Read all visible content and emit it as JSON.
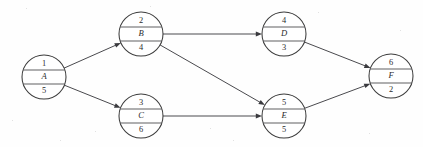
{
  "diagram": {
    "kind": "activity-network-diagram",
    "background_color": "#fefefe",
    "line_color": "#4a4a4e",
    "node_stroke_color": "#3c3c3c",
    "node_fill_color": "#ffffff",
    "text_color": "#2b2b2b",
    "node_radius": 22,
    "nodes": [
      {
        "id": "A",
        "number": "1",
        "letter": "A",
        "duration": "5",
        "cx": 44,
        "cy": 77
      },
      {
        "id": "B",
        "number": "2",
        "letter": "B",
        "duration": "4",
        "cx": 141,
        "cy": 34
      },
      {
        "id": "C",
        "number": "3",
        "letter": "C",
        "duration": "6",
        "cx": 141,
        "cy": 116
      },
      {
        "id": "D",
        "number": "4",
        "letter": "D",
        "duration": "3",
        "cx": 284,
        "cy": 34
      },
      {
        "id": "E",
        "number": "5",
        "letter": "E",
        "duration": "5",
        "cx": 284,
        "cy": 116
      },
      {
        "id": "F",
        "number": "6",
        "letter": "F",
        "duration": "2",
        "cx": 391,
        "cy": 76
      }
    ],
    "edges": [
      {
        "id": "A-B",
        "from": "A",
        "to": "B",
        "label": ""
      },
      {
        "id": "A-C",
        "from": "A",
        "to": "C",
        "label": ""
      },
      {
        "id": "B-D",
        "from": "B",
        "to": "D",
        "label": ""
      },
      {
        "id": "B-E",
        "from": "B",
        "to": "E",
        "label": ""
      },
      {
        "id": "C-E",
        "from": "C",
        "to": "E",
        "label": ""
      },
      {
        "id": "D-F",
        "from": "D",
        "to": "F",
        "label": ""
      },
      {
        "id": "E-F",
        "from": "E",
        "to": "F",
        "label": ""
      }
    ]
  }
}
